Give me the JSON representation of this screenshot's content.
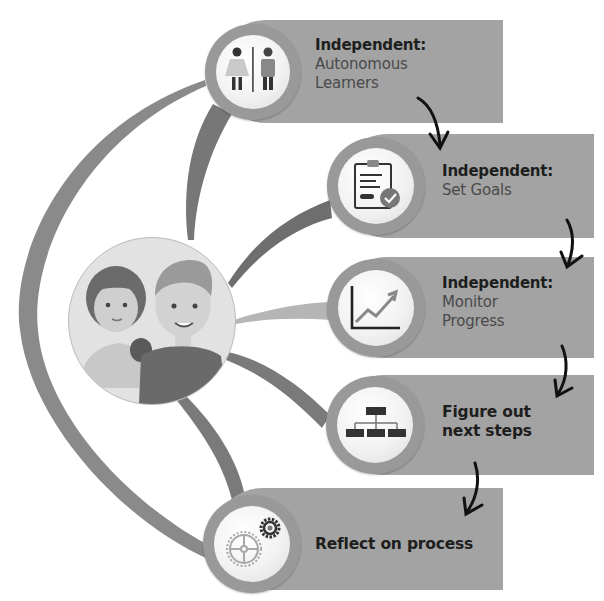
{
  "diagram": {
    "center": {
      "label": "students-avatar",
      "description": "Girl and boy illustration"
    },
    "steps": [
      {
        "id": 1,
        "title": "Independent:",
        "subtitle_lines": [
          "Autonomous",
          "Learners"
        ],
        "icon": "restroom-people-icon"
      },
      {
        "id": 2,
        "title": "Independent:",
        "subtitle_lines": [
          "Set Goals"
        ],
        "icon": "clipboard-check-icon"
      },
      {
        "id": 3,
        "title": "Independent:",
        "subtitle_lines": [
          "Monitor",
          "Progress"
        ],
        "icon": "trending-chart-icon"
      },
      {
        "id": 4,
        "title_lines": [
          "Figure out",
          "next steps"
        ],
        "icon": "org-chart-icon"
      },
      {
        "id": 5,
        "title_lines": [
          "Reflect on process"
        ],
        "icon": "gears-icon"
      }
    ],
    "flow_arrows": 4,
    "colors": {
      "box": "#a3a3a3",
      "ring": "#999999",
      "connector_dark": "#707070",
      "connector_mid": "#8a8a8a",
      "connector_light": "#b5b5b5",
      "text_dark": "#1e1e1e",
      "text_sub": "#4a4a4a"
    }
  }
}
